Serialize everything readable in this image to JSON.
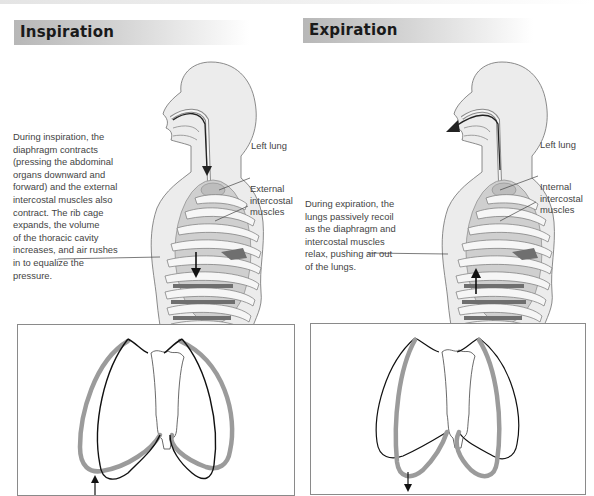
{
  "panels": {
    "inspiration": {
      "title": "Inspiration",
      "description": "During inspiration, the diaphragm contracts (pressing the abdominal organs downward and forward) and the external intercostal muscles also contract. The rib cage expands, the volume of the thoracic cavity increases, and air rushes in to equalize the pressure.",
      "description_lines": [
        "During inspiration, the",
        "diaphragm contracts",
        "(pressing the abdominal",
        "organs downward and",
        "forward) and the external",
        "intercostal muscles also",
        "contract. The rib cage",
        "expands, the volume",
        "of the thoracic cavity",
        "increases, and air rushes",
        "in to equalize the",
        "pressure."
      ],
      "labels": {
        "lung": "Left lung",
        "muscles_line1": "External",
        "muscles_line2": "intercostal",
        "muscles_line3": "muscles"
      },
      "airflow_direction": "inward",
      "diaphragm_arrow": "down",
      "ribcage_diagram": {
        "outline_gray": "expanded",
        "outline_black": "resting",
        "arrow": "up"
      }
    },
    "expiration": {
      "title": "Expiration",
      "description": "During expiration, the lungs passively recoil as the diaphragm and intercostal muscles relax, pushing air out of the lungs.",
      "description_lines": [
        "During expiration, the",
        "lungs passively recoil",
        "as the diaphragm and",
        "intercostal muscles",
        "relax, pushing air out",
        "of the lungs."
      ],
      "labels": {
        "lung": "Left lung",
        "muscles_line1": "Internal",
        "muscles_line2": "intercostal",
        "muscles_line3": "muscles"
      },
      "airflow_direction": "outward",
      "diaphragm_arrow": "up",
      "ribcage_diagram": {
        "outline_gray": "contracted",
        "outline_black": "expanded",
        "arrow": "down"
      }
    }
  },
  "colors": {
    "header_gradient_start": "#b7b7b7",
    "body_fill": "#e9e9e9",
    "body_outline": "#6e6e6e",
    "lung_fill": "#c4c4c4",
    "rib_fill": "#f4f4f4",
    "muscle_fill": "#777777",
    "gray_outline": "#9a9a9a",
    "black_outline": "#111111"
  }
}
